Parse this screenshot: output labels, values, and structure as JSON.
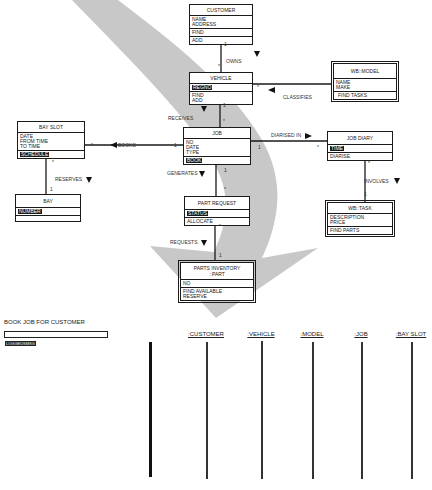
{
  "diagram": {
    "classes": {
      "customer": {
        "name": "CUSTOMER",
        "attributes": [
          "NAME",
          "ADDRESS"
        ],
        "operations": [
          "FIND",
          "ADD"
        ]
      },
      "vehicle": {
        "name": "VEHICLE",
        "attributes": [
          "REGNO"
        ],
        "operations": [
          "FIND",
          "ADD"
        ]
      },
      "model": {
        "name": "WB::MODEL",
        "attributes": [
          "NAME",
          "MAKE"
        ],
        "operations": [
          "FIND TASKS"
        ]
      },
      "bay_slot": {
        "name": "BAY SLOT",
        "attributes": [
          "DATE",
          "FROM TIME",
          "TO TIME"
        ],
        "operations": [
          "SCHEDULE"
        ]
      },
      "job": {
        "name": "JOB",
        "attributes": [
          "NO",
          "DATE",
          "TYPE"
        ],
        "operations": [
          "BOOK"
        ]
      },
      "job_diary": {
        "name": "JOB DIARY",
        "attributes": [
          "TIME"
        ],
        "operations": [
          "DIARISE"
        ]
      },
      "bay": {
        "name": "BAY",
        "attributes": [
          "NUMBER"
        ],
        "operations": [
          ""
        ]
      },
      "part_request": {
        "name": "PART REQUEST",
        "attributes": [
          "STATUS"
        ],
        "operations": [
          "ALLOCATE"
        ]
      },
      "task": {
        "name": "WB::TASK",
        "attributes": [
          "DESCRIPTION",
          "PRICE"
        ],
        "operations": [
          "FIND PARTS"
        ]
      },
      "parts_inventory": {
        "name": "PARTS INVENTORY\n::PART",
        "name_line1": "PARTS INVENTORY",
        "name_line2": "::PART",
        "attributes": [
          "NO"
        ],
        "operations": [
          "FIND AVAILABLE",
          "RESERVE"
        ]
      }
    },
    "associations": [
      {
        "label": "OWNS",
        "from": "CUSTOMER",
        "to": "VEHICLE",
        "from_mult": "1",
        "to_mult": "*"
      },
      {
        "label": "CLASSIFIES",
        "from": "WB::MODEL",
        "to": "VEHICLE",
        "from_mult": "",
        "to_mult": "*"
      },
      {
        "label": "RECEIVES",
        "from": "VEHICLE",
        "to": "JOB",
        "from_mult": "1",
        "to_mult": "*"
      },
      {
        "label": "BOOKS",
        "from": "JOB",
        "to": "BAY SLOT",
        "from_mult": "1",
        "to_mult": "*"
      },
      {
        "label": "DIARISED IN",
        "from": "JOB",
        "to": "JOB DIARY",
        "from_mult": "1",
        "to_mult": "*"
      },
      {
        "label": "RESERVES",
        "from": "BAY SLOT",
        "to": "BAY",
        "from_mult": "*",
        "to_mult": "1"
      },
      {
        "label": "GENERATES",
        "from": "JOB",
        "to": "PART REQUEST",
        "from_mult": "1",
        "to_mult": "*"
      },
      {
        "label": "INVOLVES",
        "from": "JOB DIARY",
        "to": "WB::TASK",
        "from_mult": "*",
        "to_mult": "1"
      },
      {
        "label": "REQUESTS",
        "from": "PART REQUEST",
        "to": "PARTS INVENTORY::PART",
        "from_mult": "*",
        "to_mult": "1"
      }
    ],
    "mults": {
      "one": "1",
      "many": "*"
    }
  },
  "sequence": {
    "title": "BOOK JOB FOR CUSTOMER",
    "input_value": "LOGGEDSMSG",
    "actors": [
      ":CUSTOMER",
      ":VEHICLE",
      ":MODEL",
      ":JOB",
      ":BAY SLOT"
    ]
  },
  "colors": {
    "line": "#1a1a1a",
    "arrow_fill": "#c8c8c8"
  }
}
